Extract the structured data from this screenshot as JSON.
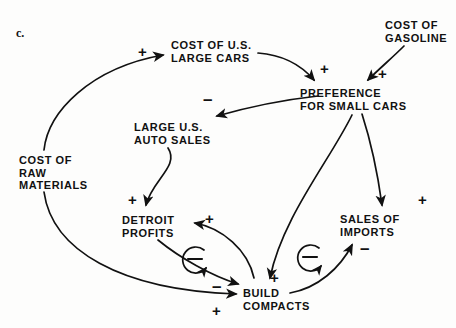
{
  "figure": {
    "panel_label": "c.",
    "type": "causal-loop-diagram",
    "background_color": "#fdfdfc",
    "ink_color": "#111111"
  },
  "nodes": [
    {
      "id": "cost-us-large-cars",
      "lines": [
        "COST OF U.S.",
        "LARGE CARS"
      ],
      "x": 171,
      "y": 39
    },
    {
      "id": "cost-of-gasoline",
      "lines": [
        "COST OF",
        "GASOLINE"
      ],
      "x": 385,
      "y": 19
    },
    {
      "id": "preference-small-cars",
      "lines": [
        "PREFERENCE",
        "FOR SMALL CARS"
      ],
      "x": 300,
      "y": 87
    },
    {
      "id": "large-us-auto-sales",
      "lines": [
        "LARGE U.S.",
        "AUTO SALES"
      ],
      "x": 134,
      "y": 121
    },
    {
      "id": "cost-of-raw-materials",
      "lines": [
        "COST OF",
        "RAW",
        "MATERIALS"
      ],
      "x": 19,
      "y": 154
    },
    {
      "id": "detroit-profits",
      "lines": [
        "DETROIT",
        "PROFITS"
      ],
      "x": 122,
      "y": 214
    },
    {
      "id": "sales-of-imports",
      "lines": [
        "SALES OF",
        "IMPORTS"
      ],
      "x": 340,
      "y": 213
    },
    {
      "id": "build-compacts",
      "lines": [
        "BUILD",
        "COMPACTS"
      ],
      "x": 243,
      "y": 287
    }
  ],
  "signs": [
    {
      "id": "sign-rawmat-to-largecars",
      "symbol": "+",
      "x": 138,
      "y": 44
    },
    {
      "id": "sign-largecars-to-preference",
      "symbol": "+",
      "x": 320,
      "y": 61
    },
    {
      "id": "sign-gasoline-to-preference",
      "symbol": "+",
      "x": 378,
      "y": 66
    },
    {
      "id": "sign-preference-to-autosales",
      "symbol": "–",
      "x": 203,
      "y": 92
    },
    {
      "id": "sign-autosales-to-detroit",
      "symbol": "+",
      "x": 128,
      "y": 192
    },
    {
      "id": "sign-preference-to-imports",
      "symbol": "+",
      "x": 418,
      "y": 192
    },
    {
      "id": "sign-compacts-to-detroit",
      "symbol": "+",
      "x": 205,
      "y": 211
    },
    {
      "id": "sign-detroit-to-compacts",
      "symbol": "–",
      "x": 212,
      "y": 281
    },
    {
      "id": "sign-preference-to-compacts",
      "symbol": "+",
      "x": 270,
      "y": 272
    },
    {
      "id": "sign-compacts-to-imports",
      "symbol": "–",
      "x": 360,
      "y": 243
    },
    {
      "id": "sign-rawmat-to-compacts",
      "symbol": "+",
      "x": 212,
      "y": 305
    }
  ],
  "loop_markers": [
    {
      "id": "balancing-loop-detroit-compacts",
      "symbol": "–",
      "cx": 195,
      "cy": 259,
      "r": 13
    },
    {
      "id": "balancing-loop-imports-compacts",
      "symbol": "–",
      "cx": 310,
      "cy": 257,
      "r": 13
    }
  ],
  "links": [
    {
      "id": "link-rawmaterials-to-cost-us-large-cars",
      "from": "cost-of-raw-materials",
      "to": "cost-us-large-cars",
      "polarity": "+"
    },
    {
      "id": "link-cost-us-large-cars-to-preference",
      "from": "cost-us-large-cars",
      "to": "preference-small-cars",
      "polarity": "+"
    },
    {
      "id": "link-gasoline-to-preference",
      "from": "cost-of-gasoline",
      "to": "preference-small-cars",
      "polarity": "+"
    },
    {
      "id": "link-preference-to-large-auto-sales",
      "from": "preference-small-cars",
      "to": "large-us-auto-sales",
      "polarity": "-"
    },
    {
      "id": "link-large-auto-sales-to-detroit-profits",
      "from": "large-us-auto-sales",
      "to": "detroit-profits",
      "polarity": "+"
    },
    {
      "id": "link-preference-to-sales-of-imports",
      "from": "preference-small-cars",
      "to": "sales-of-imports",
      "polarity": "+"
    },
    {
      "id": "link-preference-to-build-compacts",
      "from": "preference-small-cars",
      "to": "build-compacts",
      "polarity": "+"
    },
    {
      "id": "link-detroit-profits-to-build-compacts",
      "from": "detroit-profits",
      "to": "build-compacts",
      "polarity": "-"
    },
    {
      "id": "link-build-compacts-to-detroit-profits",
      "from": "build-compacts",
      "to": "detroit-profits",
      "polarity": "+"
    },
    {
      "id": "link-build-compacts-to-sales-of-imports",
      "from": "build-compacts",
      "to": "sales-of-imports",
      "polarity": "-"
    },
    {
      "id": "link-raw-materials-to-build-compacts",
      "from": "cost-of-raw-materials",
      "to": "build-compacts",
      "polarity": "+"
    }
  ]
}
